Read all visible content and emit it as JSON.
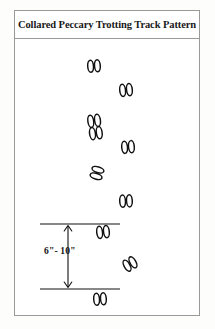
{
  "panel": {
    "title": "Collared Peccary Trotting Track Pattern",
    "border_color": "#9a9a96",
    "background_color": "#ffffff"
  },
  "diagram": {
    "ink_color": "#111111",
    "subject": "Collared Peccary",
    "gait": "Trotting",
    "track_count": 9,
    "tracks": [
      {
        "id": "track-1",
        "x": 88,
        "y": 60,
        "rotation": -4,
        "style": "pair",
        "side": "left"
      },
      {
        "id": "track-2",
        "x": 120,
        "y": 83,
        "rotation": -6,
        "style": "pair",
        "side": "right"
      },
      {
        "id": "track-3",
        "x": 86,
        "y": 114,
        "rotation": -8,
        "style": "double",
        "side": "left"
      },
      {
        "id": "track-4",
        "x": 121,
        "y": 140,
        "rotation": -5,
        "style": "pair",
        "side": "right"
      },
      {
        "id": "track-5",
        "x": 87,
        "y": 164,
        "rotation": -72,
        "style": "pair",
        "side": "left"
      },
      {
        "id": "track-6",
        "x": 119,
        "y": 194,
        "rotation": -3,
        "style": "pair",
        "side": "right"
      },
      {
        "id": "track-7",
        "x": 96,
        "y": 224,
        "rotation": -6,
        "style": "pair",
        "side": "left"
      },
      {
        "id": "track-8",
        "x": 122,
        "y": 256,
        "rotation": -28,
        "style": "pair",
        "side": "right"
      },
      {
        "id": "track-9",
        "x": 93,
        "y": 292,
        "rotation": -4,
        "style": "pair",
        "side": "left"
      }
    ]
  },
  "measurement": {
    "label": "6\"- 10\"",
    "meaning": "stride length between reference lines",
    "upper_line": {
      "x1": 40,
      "x2": 120,
      "y": 224
    },
    "lower_line": {
      "x1": 40,
      "x2": 120,
      "y": 289
    },
    "arrow": {
      "x": 68,
      "y_top": 226,
      "y_bottom": 287,
      "heads": "both"
    }
  }
}
